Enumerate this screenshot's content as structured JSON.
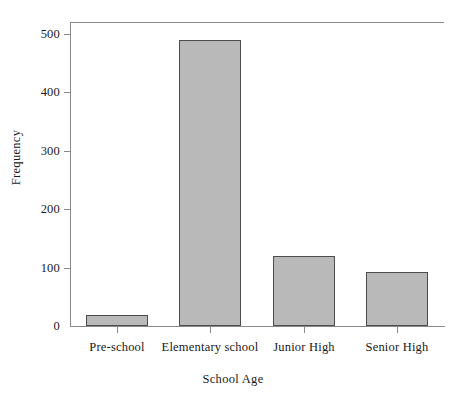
{
  "chart_data": {
    "type": "bar",
    "title": "",
    "xlabel": "School Age",
    "ylabel": "Frequency",
    "categories": [
      "Pre-school",
      "Elementary school",
      "Junior High",
      "Senior High"
    ],
    "values": [
      18,
      490,
      120,
      92
    ],
    "ylim": [
      0,
      520
    ],
    "yticks": [
      0,
      100,
      200,
      300,
      400,
      500
    ],
    "ytick_labels": [
      "0",
      "100",
      "200",
      "300",
      "400",
      "500"
    ],
    "grid": false,
    "legend": false,
    "bar_fill_color": "#b9b9b9",
    "bar_edge_color": "#4c4c4c",
    "axis_color": "#8a8a8a"
  }
}
